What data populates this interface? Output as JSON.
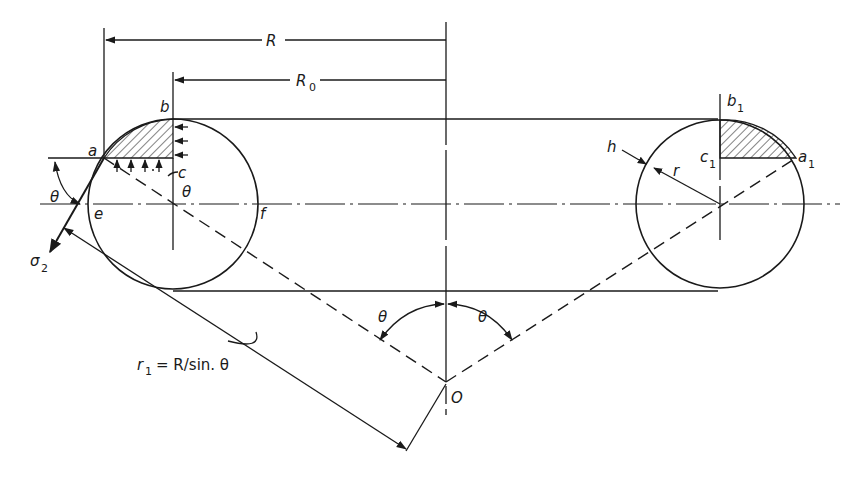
{
  "diagram": {
    "labels": {
      "R": "R",
      "R0": "R",
      "R0_sub": "0",
      "a": "a",
      "b": "b",
      "c": "c",
      "e": "e",
      "f": "f",
      "theta_left": "θ",
      "theta_center_small": "θ",
      "theta_O_left": "θ",
      "theta_O_right": "θ",
      "sigma": "σ",
      "sigma_sub": "2",
      "O": "O",
      "h": "h",
      "r": "r",
      "a1": "a",
      "a1_sub": "1",
      "b1": "b",
      "b1_sub": "1",
      "c1": "c",
      "c1_sub": "1",
      "r1": "r",
      "r1_sub": "1",
      "r1_eq": "= R/sin. θ"
    },
    "colors": {
      "ink": "#1a1a1a",
      "background": "#ffffff"
    }
  }
}
